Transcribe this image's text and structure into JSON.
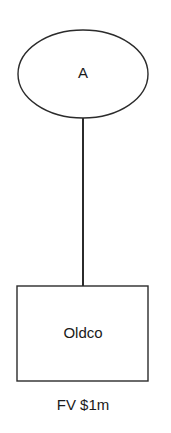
{
  "diagram": {
    "type": "structure-chart",
    "nodes": [
      {
        "id": "A",
        "shape": "ellipse",
        "label": "A"
      },
      {
        "id": "Oldco",
        "shape": "rectangle",
        "label": "Oldco",
        "annotation": "FV $1m"
      }
    ],
    "edges": [
      {
        "from": "A",
        "to": "Oldco",
        "style": "solid"
      }
    ]
  },
  "colors": {
    "stroke": "#2b2b2b",
    "background": "#ffffff",
    "text": "#1a1a1a"
  }
}
